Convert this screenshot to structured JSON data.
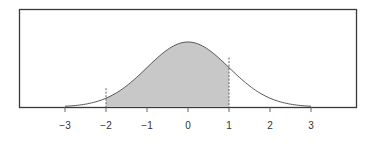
{
  "chart_data": {
    "type": "area",
    "title": "",
    "xlabel": "",
    "ylabel": "",
    "curve": "standard normal pdf",
    "mean": 0,
    "std": 1,
    "xlim": [
      -4.3,
      4.1
    ],
    "x_ticks": [
      -3,
      -2,
      -1,
      0,
      1,
      2,
      3
    ],
    "x_tick_labels": [
      "−3",
      "−2",
      "−1",
      "0",
      "1",
      "2",
      "3"
    ],
    "curve_drawn_range": [
      -3,
      3
    ],
    "shaded_region": {
      "from": -2,
      "to": 1
    },
    "markers": [
      {
        "x": -2,
        "style": "dashed"
      },
      {
        "x": 1,
        "style": "dashed"
      }
    ],
    "grid": false,
    "legend": null
  },
  "colors": {
    "frame": "#3a3a3a",
    "curve": "#555555",
    "shade": "#c8c8c8",
    "text": "#333333"
  }
}
